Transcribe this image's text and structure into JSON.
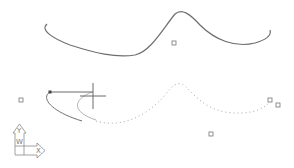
{
  "app": {
    "type": "cad-drawing-canvas"
  },
  "colors": {
    "background": "#ffffff",
    "spline": "#6e6e6e",
    "preview": "#a8a8a8",
    "grip": "#777777",
    "crosshair": "#6a6a6a",
    "ucs": "#8a8a8a"
  },
  "spline": {
    "path": "M47 24 C 40 30, 52 38, 70 45 C 95 53, 115 58, 135 55 C 150 52, 162 30, 175 14 C 182 8, 190 14, 200 25 C 215 40, 235 48, 255 43 C 265 40, 272 36, 270 30"
  },
  "preview_curve": {
    "solid_path": "M50 92 C 40 98, 52 112, 82 121",
    "inner_path": "M92 92 C 72 100, 72 112, 96 120",
    "dotted_path": "M96 121 C 120 128, 145 118, 165 95 C 172 86, 178 80, 185 86 C 195 96, 205 108, 225 112 C 245 115, 262 112, 272 100"
  },
  "rubberband": {
    "x1": 50,
    "y1": 92,
    "x2": 93,
    "y2": 92
  },
  "first_point": {
    "x": 50,
    "y": 92
  },
  "crosshair": {
    "x": 93,
    "y": 96,
    "size": 13
  },
  "grips": [
    {
      "x": 174,
      "y": 43
    },
    {
      "x": 21,
      "y": 100
    },
    {
      "x": 270,
      "y": 100
    },
    {
      "x": 278,
      "y": 105
    },
    {
      "x": 211,
      "y": 134
    }
  ],
  "ucs_icon": {
    "x_label": "X",
    "y_label": "Y",
    "w_label": "W"
  }
}
